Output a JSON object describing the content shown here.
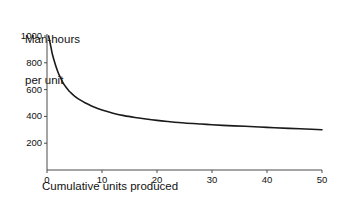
{
  "chart_data": {
    "type": "line",
    "title": "",
    "ylabel_line1": "Man-hours",
    "ylabel_line2": "per unit",
    "xlabel": "Cumulative units produced",
    "xlim": [
      0,
      50
    ],
    "ylim": [
      0,
      1000
    ],
    "grid": false,
    "legend": false,
    "line_color": "#1a1a1a",
    "axis_color": "#4a4a4a",
    "background": "#ffffff",
    "xticks": [
      0,
      10,
      20,
      30,
      40,
      50
    ],
    "xtick_labels": [
      "0",
      "10",
      "20",
      "30",
      "40",
      "50"
    ],
    "yticks": [
      200,
      400,
      600,
      800,
      1000
    ],
    "ytick_labels": [
      "200",
      "400",
      "600",
      "800",
      "1000"
    ],
    "series": [
      {
        "name": "Learning curve",
        "x": [
          0.3,
          0.5,
          0.8,
          1,
          1.5,
          2,
          2.5,
          3,
          3.5,
          4,
          4.5,
          5,
          6,
          7,
          8,
          9,
          10,
          12,
          14,
          16,
          18,
          20,
          22,
          25,
          28,
          30,
          33,
          36,
          40,
          44,
          47,
          50
        ],
        "values": [
          1000,
          960,
          900,
          860,
          790,
          730,
          685,
          645,
          615,
          590,
          570,
          552,
          523,
          500,
          480,
          463,
          448,
          424,
          406,
          392,
          380,
          370,
          362,
          351,
          343,
          338,
          331,
          326,
          318,
          311,
          306,
          300
        ]
      }
    ]
  }
}
